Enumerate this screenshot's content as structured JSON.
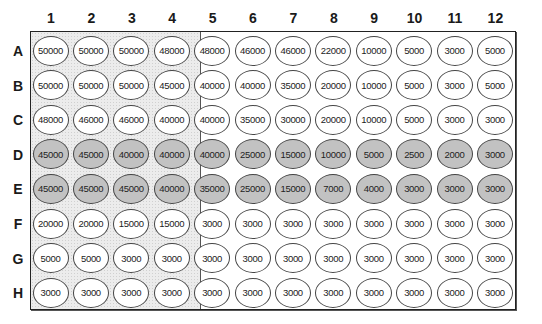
{
  "plate": {
    "columns": [
      "1",
      "2",
      "3",
      "4",
      "5",
      "6",
      "7",
      "8",
      "9",
      "10",
      "11",
      "12"
    ],
    "rows": [
      "A",
      "B",
      "C",
      "D",
      "E",
      "F",
      "G",
      "H"
    ],
    "shaded_columns": [
      "1",
      "2",
      "3",
      "4"
    ],
    "colors": {
      "well_fill_highlighted": "#c2c2c2",
      "well_fill_default": "#ffffff",
      "shaded_region": "#ececec",
      "border": "#222222"
    },
    "highlighted_rows": [
      "D",
      "E"
    ],
    "wells": {
      "A": [
        "50000",
        "50000",
        "50000",
        "48000",
        "48000",
        "46000",
        "46000",
        "22000",
        "10000",
        "5000",
        "3000",
        "5000"
      ],
      "B": [
        "50000",
        "50000",
        "50000",
        "45000",
        "40000",
        "40000",
        "35000",
        "20000",
        "10000",
        "5000",
        "3000",
        "5000"
      ],
      "C": [
        "48000",
        "46000",
        "46000",
        "40000",
        "40000",
        "35000",
        "30000",
        "20000",
        "10000",
        "5000",
        "3000",
        "3000"
      ],
      "D": [
        "45000",
        "45000",
        "40000",
        "40000",
        "40000",
        "25000",
        "15000",
        "10000",
        "5000",
        "2500",
        "2000",
        "3000"
      ],
      "E": [
        "45000",
        "45000",
        "45000",
        "40000",
        "35000",
        "25000",
        "15000",
        "7000",
        "4000",
        "3000",
        "3000",
        "3000"
      ],
      "F": [
        "20000",
        "20000",
        "15000",
        "15000",
        "3000",
        "3000",
        "3000",
        "3000",
        "3000",
        "3000",
        "3000",
        "3000"
      ],
      "G": [
        "5000",
        "5000",
        "3000",
        "3000",
        "3000",
        "3000",
        "3000",
        "3000",
        "3000",
        "3000",
        "3000",
        "3000"
      ],
      "H": [
        "3000",
        "3000",
        "3000",
        "3000",
        "3000",
        "3000",
        "3000",
        "3000",
        "3000",
        "3000",
        "3000",
        "3000"
      ]
    }
  }
}
